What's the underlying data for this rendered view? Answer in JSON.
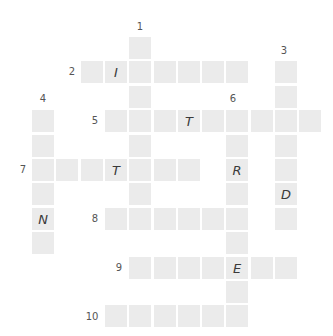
{
  "puzzle": {
    "type": "crossword",
    "colors": {
      "cell": "#ebebeb",
      "letter": "#3a3a3a",
      "number": "#555555",
      "background": "#ffffff"
    },
    "grid_geometry": {
      "origin_x": 32,
      "origin_y": 37,
      "pitch_x": 24.3,
      "pitch_y": 24.4,
      "cell_size": 22
    },
    "words": [
      {
        "number": "1",
        "direction": "down",
        "row": 0,
        "col": 4,
        "length": 8,
        "letters": [
          "",
          "",
          "",
          "",
          "",
          "",
          "",
          ""
        ]
      },
      {
        "number": "2",
        "direction": "across",
        "row": 1,
        "col": 2,
        "length": 7,
        "letters": [
          "",
          "I",
          "",
          "",
          "",
          "",
          ""
        ]
      },
      {
        "number": "3",
        "direction": "down",
        "row": 1,
        "col": 10,
        "length": 7,
        "letters": [
          "",
          "",
          "",
          "",
          "",
          "D",
          ""
        ]
      },
      {
        "number": "4",
        "direction": "down",
        "row": 3,
        "col": 0,
        "length": 6,
        "letters": [
          "",
          "",
          "",
          "",
          "N",
          ""
        ]
      },
      {
        "number": "5",
        "direction": "across",
        "row": 3,
        "col": 3,
        "length": 9,
        "letters": [
          "",
          "",
          "",
          "T",
          "",
          "",
          "",
          "",
          ""
        ]
      },
      {
        "number": "6",
        "direction": "down",
        "row": 3,
        "col": 8,
        "length": 9,
        "letters": [
          "",
          "",
          "R",
          "",
          "",
          "",
          "E",
          "",
          ""
        ]
      },
      {
        "number": "7",
        "direction": "across",
        "row": 5,
        "col": 0,
        "length": 7,
        "letters": [
          "",
          "",
          "",
          "T",
          "",
          "",
          ""
        ]
      },
      {
        "number": "8",
        "direction": "across",
        "row": 7,
        "col": 3,
        "length": 6,
        "letters": [
          "",
          "",
          "",
          "",
          "",
          ""
        ]
      },
      {
        "number": "9",
        "direction": "across",
        "row": 9,
        "col": 4,
        "length": 7,
        "letters": [
          "",
          "",
          "",
          "",
          "E",
          "",
          ""
        ]
      },
      {
        "number": "10",
        "direction": "across",
        "row": 11,
        "col": 3,
        "length": 6,
        "letters": [
          "",
          "",
          "",
          "",
          "",
          ""
        ]
      }
    ],
    "labels": [
      {
        "text": "1",
        "x": 140,
        "y": 27
      },
      {
        "text": "2",
        "x": 72,
        "y": 72
      },
      {
        "text": "3",
        "x": 284,
        "y": 51
      },
      {
        "text": "4",
        "x": 43,
        "y": 99
      },
      {
        "text": "5",
        "x": 95,
        "y": 121
      },
      {
        "text": "6",
        "x": 233,
        "y": 99
      },
      {
        "text": "7",
        "x": 23,
        "y": 170
      },
      {
        "text": "8",
        "x": 95,
        "y": 219
      },
      {
        "text": "9",
        "x": 119,
        "y": 268
      },
      {
        "text": "10",
        "x": 92,
        "y": 317
      }
    ]
  }
}
